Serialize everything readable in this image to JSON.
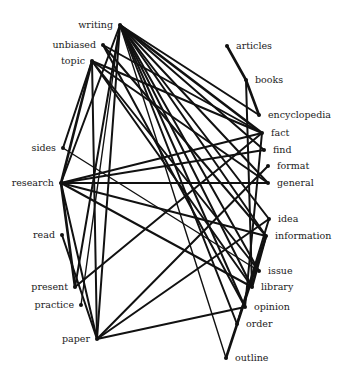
{
  "diagram": {
    "type": "word-association-network",
    "nodes": [
      {
        "id": "writing",
        "label": "writing",
        "side": "left"
      },
      {
        "id": "unbiased",
        "label": "unbiased",
        "side": "left"
      },
      {
        "id": "topic",
        "label": "topic",
        "side": "left"
      },
      {
        "id": "sides",
        "label": "sides",
        "side": "left"
      },
      {
        "id": "research",
        "label": "research",
        "side": "left"
      },
      {
        "id": "read",
        "label": "read",
        "side": "left"
      },
      {
        "id": "present",
        "label": "present",
        "side": "left"
      },
      {
        "id": "practice",
        "label": "practice",
        "side": "left"
      },
      {
        "id": "paper",
        "label": "paper",
        "side": "left"
      },
      {
        "id": "articles",
        "label": "articles",
        "side": "right"
      },
      {
        "id": "books",
        "label": "books",
        "side": "right"
      },
      {
        "id": "encyclopedia",
        "label": "encyclopedia",
        "side": "right"
      },
      {
        "id": "fact",
        "label": "fact",
        "side": "right"
      },
      {
        "id": "find",
        "label": "find",
        "side": "right"
      },
      {
        "id": "format",
        "label": "format",
        "side": "right"
      },
      {
        "id": "general",
        "label": "general",
        "side": "right"
      },
      {
        "id": "idea",
        "label": "idea",
        "side": "right"
      },
      {
        "id": "information",
        "label": "information",
        "side": "right"
      },
      {
        "id": "issue",
        "label": "issue",
        "side": "right"
      },
      {
        "id": "library",
        "label": "library",
        "side": "right"
      },
      {
        "id": "opinion",
        "label": "opinion",
        "side": "right"
      },
      {
        "id": "order",
        "label": "order",
        "side": "right"
      },
      {
        "id": "outline",
        "label": "outline",
        "side": "right"
      }
    ],
    "edges": [
      {
        "from": "writing",
        "to": "fact",
        "weight": 3
      },
      {
        "from": "writing",
        "to": "encyclopedia",
        "weight": 2
      },
      {
        "from": "writing",
        "to": "find",
        "weight": 2
      },
      {
        "from": "writing",
        "to": "general",
        "weight": 2
      },
      {
        "from": "writing",
        "to": "idea",
        "weight": 2
      },
      {
        "from": "writing",
        "to": "information",
        "weight": 2
      },
      {
        "from": "writing",
        "to": "issue",
        "weight": 2
      },
      {
        "from": "writing",
        "to": "library",
        "weight": 2
      },
      {
        "from": "writing",
        "to": "opinion",
        "weight": 2
      },
      {
        "from": "writing",
        "to": "outline",
        "weight": 1
      },
      {
        "from": "writing",
        "to": "paper",
        "weight": 2
      },
      {
        "from": "writing",
        "to": "research",
        "weight": 2
      },
      {
        "from": "writing",
        "to": "present",
        "weight": 2
      },
      {
        "from": "writing",
        "to": "practice",
        "weight": 1
      },
      {
        "from": "writing",
        "to": "order",
        "weight": 2
      },
      {
        "from": "unbiased",
        "to": "fact",
        "weight": 2
      },
      {
        "from": "unbiased",
        "to": "information",
        "weight": 2
      },
      {
        "from": "unbiased",
        "to": "opinion",
        "weight": 2
      },
      {
        "from": "topic",
        "to": "fact",
        "weight": 2
      },
      {
        "from": "topic",
        "to": "general",
        "weight": 2
      },
      {
        "from": "topic",
        "to": "research",
        "weight": 3
      },
      {
        "from": "topic",
        "to": "paper",
        "weight": 2
      },
      {
        "from": "topic",
        "to": "issue",
        "weight": 2
      },
      {
        "from": "topic",
        "to": "library",
        "weight": 2
      },
      {
        "from": "topic",
        "to": "sides",
        "weight": 2
      },
      {
        "from": "sides",
        "to": "issue",
        "weight": 1
      },
      {
        "from": "research",
        "to": "fact",
        "weight": 2
      },
      {
        "from": "research",
        "to": "find",
        "weight": 2
      },
      {
        "from": "research",
        "to": "general",
        "weight": 2
      },
      {
        "from": "research",
        "to": "information",
        "weight": 2
      },
      {
        "from": "research",
        "to": "library",
        "weight": 2
      },
      {
        "from": "research",
        "to": "paper",
        "weight": 2
      },
      {
        "from": "research",
        "to": "present",
        "weight": 3
      },
      {
        "from": "read",
        "to": "paper",
        "weight": 2
      },
      {
        "from": "present",
        "to": "fact",
        "weight": 2
      },
      {
        "from": "paper",
        "to": "format",
        "weight": 2
      },
      {
        "from": "paper",
        "to": "opinion",
        "weight": 2
      },
      {
        "from": "paper",
        "to": "idea",
        "weight": 2
      },
      {
        "from": "articles",
        "to": "books",
        "weight": 3
      },
      {
        "from": "books",
        "to": "encyclopedia",
        "weight": 3
      },
      {
        "from": "books",
        "to": "library",
        "weight": 2
      },
      {
        "from": "fact",
        "to": "opinion",
        "weight": 2
      },
      {
        "from": "information",
        "to": "library",
        "weight": 3
      },
      {
        "from": "information",
        "to": "outline",
        "weight": 3
      },
      {
        "from": "idea",
        "to": "order",
        "weight": 2
      }
    ]
  }
}
